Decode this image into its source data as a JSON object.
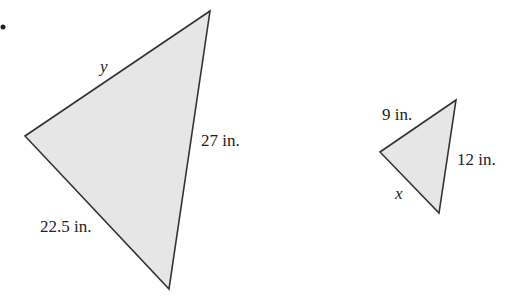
{
  "figure": {
    "bullet": "•",
    "large_triangle": {
      "vertices": [
        [
          210,
          11
        ],
        [
          25,
          136
        ],
        [
          169,
          289
        ]
      ],
      "fill": "#e6e6e6",
      "stroke": "#333333",
      "labels": {
        "top_left_side": "y",
        "right_side": "27 in.",
        "bottom_left_side": "22.5 in."
      }
    },
    "small_triangle": {
      "vertices": [
        [
          456,
          100
        ],
        [
          380,
          152
        ],
        [
          439,
          213
        ]
      ],
      "fill": "#e6e6e6",
      "stroke": "#333333",
      "labels": {
        "top_left_side": "9 in.",
        "right_side": "12 in.",
        "bottom_left_side": "x"
      }
    }
  }
}
